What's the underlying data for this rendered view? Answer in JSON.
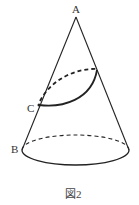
{
  "figure": {
    "caption": "図2",
    "labels": {
      "apex": "A",
      "base_point": "B",
      "curve_point": "C"
    }
  }
}
